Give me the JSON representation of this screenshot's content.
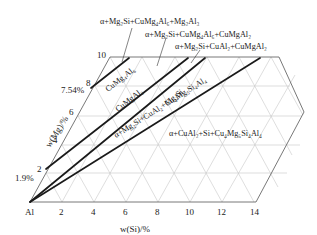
{
  "diagram": {
    "type": "ternary-section phase diagram (Al-corner, Mg-Si)",
    "x_axis": {
      "label": "w(Si)/%",
      "ticks": [
        "Al",
        "2",
        "4",
        "6",
        "8",
        "10",
        "12",
        "14"
      ]
    },
    "y_axis": {
      "label": "w(Mg)/%",
      "ticks": [
        "2",
        "4",
        "6",
        "8",
        "10"
      ],
      "special_marks": [
        "1.9%",
        "7.54%"
      ]
    },
    "phase_labels": {
      "top1": "α+Mg₂Si+CuMg₄Al₆+Mg₂Al₃",
      "top2": "α+Mg₂Si+CuMg₄Al₆+CuMgAl₂",
      "top3": "α+Mg₂Si+CuAl₂+CuMgAl₂",
      "region_a": "CuMg₄Al₆",
      "region_b": "CuMgAl₂",
      "region_c": "Mg₂Si",
      "region_d": "α+Mg₂Si+CuAl₂+Cu₄Mg₅Si₄Al₄",
      "region_e": "α+CuAl₂+Si+Cu₄Mg₅Si₄Al₄"
    },
    "colors": {
      "boundary_lines": "#1a1a1a",
      "grid": "#c8c8c8",
      "frame": "#555555"
    }
  }
}
